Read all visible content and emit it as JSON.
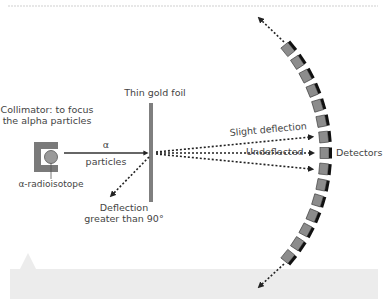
{
  "diagram": {
    "labels": {
      "collimator_line1": "Collimator: to focus",
      "collimator_line2": "the alpha particles",
      "radioisotope": "α-radioisotope",
      "alpha_symbol": "α",
      "alpha_particles": "particles",
      "gold_foil": "Thin gold foil",
      "slight_deflection": "Slight deflection",
      "undeflected": "Undeflected",
      "detectors": "Detectors",
      "deflection_line1": "Deflection",
      "deflection_line2": "greater than 90°"
    },
    "colors": {
      "foil": "#7f7f7f",
      "detector_face": "#8c8c8c",
      "detector_edge": "#111111",
      "collimator": "#7a7a7a",
      "source": "#9a9a9a",
      "text": "#444444",
      "footer_band": "#ececec",
      "top_rule": "#cfcfcf"
    },
    "detector_count": 15,
    "detector_arc": {
      "cx": 160,
      "cy": 153,
      "r": 165,
      "start_deg": -39,
      "end_deg": 39
    }
  }
}
